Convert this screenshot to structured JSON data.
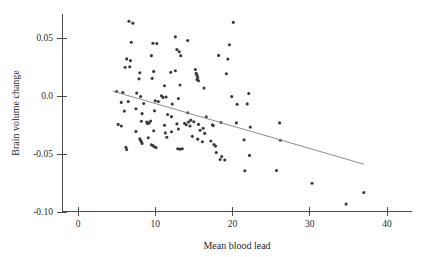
{
  "chart_data": {
    "type": "scatter",
    "title": "",
    "xlabel": "Mean blood lead",
    "ylabel": "Brain volume change",
    "xlim": [
      -1,
      43
    ],
    "ylim": [
      -0.118,
      0.072
    ],
    "grid": false,
    "legend": null,
    "xticks": [
      0,
      10,
      20,
      30,
      40
    ],
    "xtick_labels": [
      "0",
      "10",
      "20",
      "30",
      "40"
    ],
    "yticks": [
      0.05,
      0.0,
      -0.05,
      -0.1
    ],
    "ytick_labels": [
      "0.05",
      "0.0",
      "-0.05",
      "-0.10"
    ],
    "point_color": "#3a3a3c",
    "line_color": "#8d8d8d",
    "axis_color": "#4a4a4a",
    "trend_line": {
      "name": "linear fit",
      "x_start": 4.5,
      "y_start": 0.0042,
      "x_end": 37.0,
      "y_end": -0.0588
    },
    "series": [
      {
        "name": "subjects",
        "points": [
          [
            6.6,
            0.0645
          ],
          [
            7.1,
            0.0628
          ],
          [
            20.1,
            0.0635
          ],
          [
            6.9,
            0.0463
          ],
          [
            9.7,
            0.0455
          ],
          [
            10.2,
            0.0452
          ],
          [
            12.6,
            0.051
          ],
          [
            14.2,
            0.0478
          ],
          [
            19.6,
            0.0442
          ],
          [
            6.3,
            0.032
          ],
          [
            6.8,
            0.0305
          ],
          [
            9.5,
            0.0348
          ],
          [
            12.8,
            0.04
          ],
          [
            13.1,
            0.0382
          ],
          [
            13.3,
            0.0348
          ],
          [
            18.2,
            0.035
          ],
          [
            19.4,
            0.0318
          ],
          [
            6.1,
            0.0248
          ],
          [
            6.7,
            0.0252
          ],
          [
            8.0,
            0.02
          ],
          [
            9.8,
            0.0212
          ],
          [
            12.0,
            0.0205
          ],
          [
            12.6,
            0.0218
          ],
          [
            15.2,
            0.0228
          ],
          [
            15.3,
            0.0196
          ],
          [
            15.4,
            0.0178
          ],
          [
            15.5,
            0.016
          ],
          [
            19.2,
            0.0192
          ],
          [
            7.9,
            0.0148
          ],
          [
            9.6,
            0.0152
          ],
          [
            11.2,
            0.0088
          ],
          [
            13.2,
            0.0095
          ],
          [
            15.4,
            0.0142
          ],
          [
            15.6,
            0.0132
          ],
          [
            16.3,
            0.0068
          ],
          [
            5.0,
            0.0038
          ],
          [
            5.8,
            0.003
          ],
          [
            7.6,
            0.0025
          ],
          [
            8.1,
            -0.0005
          ],
          [
            10.8,
            0.0002
          ],
          [
            11.0,
            -0.0012
          ],
          [
            11.4,
            -0.0008
          ],
          [
            13.0,
            -0.0022
          ],
          [
            19.9,
            -0.0005
          ],
          [
            5.6,
            -0.0055
          ],
          [
            6.5,
            -0.0048
          ],
          [
            8.5,
            -0.0065
          ],
          [
            10.0,
            -0.0042
          ],
          [
            10.4,
            -0.0048
          ],
          [
            12.2,
            -0.007
          ],
          [
            20.6,
            -0.0072
          ],
          [
            21.9,
            -0.0068
          ],
          [
            22.1,
            0.0022
          ],
          [
            6.0,
            -0.013
          ],
          [
            7.5,
            -0.011
          ],
          [
            8.3,
            -0.0152
          ],
          [
            9.9,
            -0.0128
          ],
          [
            11.6,
            -0.016
          ],
          [
            12.1,
            -0.0178
          ],
          [
            14.2,
            -0.0145
          ],
          [
            14.6,
            -0.0208
          ],
          [
            16.6,
            -0.018
          ],
          [
            5.2,
            -0.0245
          ],
          [
            5.6,
            -0.0258
          ],
          [
            8.2,
            -0.0218
          ],
          [
            8.9,
            -0.0225
          ],
          [
            9.0,
            -0.0238
          ],
          [
            9.2,
            -0.0232
          ],
          [
            9.4,
            -0.0215
          ],
          [
            11.2,
            -0.0252
          ],
          [
            12.8,
            -0.024
          ],
          [
            13.8,
            -0.0235
          ],
          [
            14.0,
            -0.0248
          ],
          [
            14.3,
            -0.0225
          ],
          [
            14.5,
            -0.0258
          ],
          [
            15.0,
            -0.0222
          ],
          [
            15.6,
            -0.0245
          ],
          [
            17.4,
            -0.0248
          ],
          [
            18.5,
            -0.0228
          ],
          [
            20.5,
            -0.0232
          ],
          [
            22.3,
            -0.0268
          ],
          [
            26.1,
            -0.0232
          ],
          [
            7.5,
            -0.0305
          ],
          [
            9.8,
            -0.03
          ],
          [
            11.3,
            -0.0318
          ],
          [
            12.1,
            -0.0308
          ],
          [
            13.0,
            -0.0285
          ],
          [
            15.8,
            -0.0295
          ],
          [
            16.2,
            -0.0278
          ],
          [
            16.4,
            -0.0322
          ],
          [
            17.5,
            -0.0255
          ],
          [
            8.0,
            -0.0368
          ],
          [
            8.1,
            -0.0382
          ],
          [
            8.2,
            -0.0395
          ],
          [
            8.3,
            -0.041
          ],
          [
            9.1,
            -0.036
          ],
          [
            11.5,
            -0.0355
          ],
          [
            14.8,
            -0.0348
          ],
          [
            15.5,
            -0.0372
          ],
          [
            16.1,
            -0.0395
          ],
          [
            17.2,
            -0.0388
          ],
          [
            17.6,
            -0.0418
          ],
          [
            17.8,
            -0.0432
          ],
          [
            21.5,
            -0.0378
          ],
          [
            26.2,
            -0.0382
          ],
          [
            6.2,
            -0.0442
          ],
          [
            6.3,
            -0.0462
          ],
          [
            9.5,
            -0.042
          ],
          [
            9.7,
            -0.0428
          ],
          [
            9.9,
            -0.0438
          ],
          [
            10.1,
            -0.0445
          ],
          [
            12.9,
            -0.0455
          ],
          [
            13.2,
            -0.0458
          ],
          [
            13.5,
            -0.0455
          ],
          [
            17.9,
            -0.0488
          ],
          [
            18.4,
            -0.0548
          ],
          [
            18.6,
            -0.0522
          ],
          [
            19.0,
            -0.0552
          ],
          [
            22.2,
            -0.0512
          ],
          [
            21.6,
            -0.0645
          ],
          [
            25.7,
            -0.0642
          ],
          [
            30.3,
            -0.0752
          ],
          [
            37.0,
            -0.0832
          ],
          [
            34.7,
            -0.0932
          ]
        ]
      }
    ]
  }
}
